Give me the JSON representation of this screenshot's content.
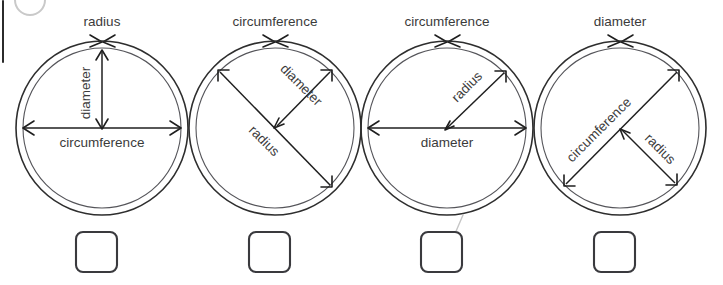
{
  "page": {
    "background_color": "#ffffff",
    "width": 723,
    "height": 285
  },
  "artifacts": {
    "scrollbar": {
      "name": "scrollbar-sliver",
      "color": "#2b2b2b"
    },
    "corner_arc": {
      "name": "cropped-circle-icon",
      "color": "#c9c9c9"
    },
    "pen_mark": {
      "name": "handwritten-pen-stroke",
      "color": "#c6c6c6",
      "belongs_to_figure": 3
    }
  },
  "labels": {
    "radius": "radius",
    "diameter": "diameter",
    "circumference": "circumference"
  },
  "figures": [
    {
      "index": 1,
      "id": "circle-figure-1",
      "top_label": "radius",
      "top_label_refers_to": "outer-ring",
      "labels": [
        {
          "text": "radius",
          "position": "above-circle",
          "points_to": "outer-ring",
          "orientation": "horizontal"
        },
        {
          "text": "diameter",
          "position": "vertical-center-left",
          "points_to": "vertical-arrow-top-to-center",
          "orientation": "vertical"
        },
        {
          "text": "circumference",
          "position": "below-horizontal-arrow",
          "points_to": "horizontal-full-width-arrow",
          "orientation": "horizontal"
        }
      ],
      "checkbox": {
        "checked": false,
        "marked": false
      }
    },
    {
      "index": 2,
      "id": "circle-figure-2",
      "top_label": "circumference",
      "top_label_refers_to": "outer-ring",
      "labels": [
        {
          "text": "circumference",
          "position": "above-circle",
          "points_to": "outer-ring",
          "orientation": "horizontal"
        },
        {
          "text": "diameter",
          "position": "upper-right-diagonal",
          "points_to": "short-diagonal-NE-to-center",
          "orientation": "diagonal-down-right"
        },
        {
          "text": "radius",
          "position": "long-diagonal",
          "points_to": "long-diagonal-NW-to-SE",
          "orientation": "diagonal-down-right"
        }
      ],
      "checkbox": {
        "checked": false,
        "marked": false
      }
    },
    {
      "index": 3,
      "id": "circle-figure-3",
      "top_label": "circumference",
      "top_label_refers_to": "outer-ring",
      "labels": [
        {
          "text": "circumference",
          "position": "above-circle",
          "points_to": "outer-ring",
          "orientation": "horizontal"
        },
        {
          "text": "radius",
          "position": "upper-right-diagonal",
          "points_to": "diagonal-center-to-NE-edge",
          "orientation": "diagonal-up-right"
        },
        {
          "text": "diameter",
          "position": "below-horizontal-arrow",
          "points_to": "horizontal-full-width-arrow",
          "orientation": "horizontal"
        }
      ],
      "checkbox": {
        "checked": false,
        "marked": true
      }
    },
    {
      "index": 4,
      "id": "circle-figure-4",
      "top_label": "diameter",
      "top_label_refers_to": "outer-ring",
      "labels": [
        {
          "text": "diameter",
          "position": "above-circle",
          "points_to": "outer-ring",
          "orientation": "horizontal"
        },
        {
          "text": "circumference",
          "position": "long-diagonal",
          "points_to": "long-diagonal-SW-to-NE",
          "orientation": "diagonal-up-right"
        },
        {
          "text": "radius",
          "position": "lower-right-diagonal",
          "points_to": "short-diagonal-center-to-SE",
          "orientation": "diagonal-down-right"
        }
      ],
      "checkbox": {
        "checked": false,
        "marked": false
      }
    }
  ]
}
